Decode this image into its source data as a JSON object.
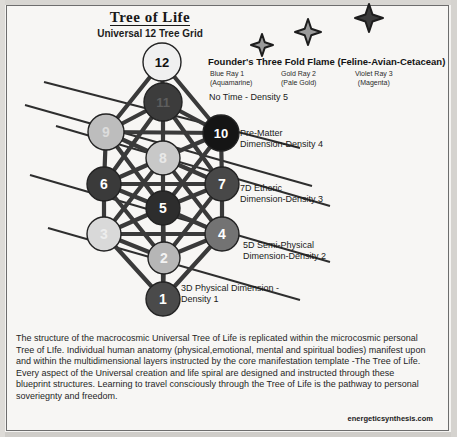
{
  "header": {
    "title": "Tree of Life",
    "subtitle": "Universal 12 Tree Grid"
  },
  "flame": {
    "heading": "Founder's Three Fold Flame (Feline-Avian-Cetacean)",
    "rays": [
      {
        "name": "Blue Ray 1",
        "color_note": "(Aquamarine)"
      },
      {
        "name": "Gold Ray 2",
        "color_note": "(Pale Gold)"
      },
      {
        "name": "Violet Ray 3",
        "color_note": "(Magenta)"
      }
    ],
    "star_count": 3
  },
  "density_labels": {
    "d5": "No Time - Density 5",
    "d4_line1": "Pre-Matter",
    "d4_line2": "Dimension-Density 4",
    "d3_line1": "7D Etheric",
    "d3_line2": "Dimension-Density 3",
    "d2_line1": "5D Semi-Physical",
    "d2_line2": "Dimension-Density 2",
    "d1_line1": "3D Physical Dimension -",
    "d1_line2": "Density 1"
  },
  "nodes": [
    {
      "id": 1,
      "label": "1",
      "cx": 163,
      "cy": 299,
      "r": 17,
      "fill": "#4a4a4a",
      "text": "#ffffff"
    },
    {
      "id": 2,
      "label": "2",
      "cx": 164,
      "cy": 258,
      "r": 16,
      "fill": "#b6b6b6",
      "text": "#f2f2f2"
    },
    {
      "id": 3,
      "label": "3",
      "cx": 104,
      "cy": 234,
      "r": 17,
      "fill": "#d9d9d9",
      "text": "#ededed"
    },
    {
      "id": 4,
      "label": "4",
      "cx": 222,
      "cy": 234,
      "r": 17,
      "fill": "#737373",
      "text": "#ffffff"
    },
    {
      "id": 5,
      "label": "5",
      "cx": 163,
      "cy": 208,
      "r": 17,
      "fill": "#2d2d2d",
      "text": "#ffffff"
    },
    {
      "id": 6,
      "label": "6",
      "cx": 104,
      "cy": 184,
      "r": 17,
      "fill": "#3a3a3a",
      "text": "#ffffff"
    },
    {
      "id": 7,
      "label": "7",
      "cx": 222,
      "cy": 184,
      "r": 17,
      "fill": "#484848",
      "text": "#ffffff"
    },
    {
      "id": 8,
      "label": "8",
      "cx": 163,
      "cy": 158,
      "r": 17,
      "fill": "#c8c8c8",
      "text": "#e8e8e8"
    },
    {
      "id": 9,
      "label": "9",
      "cx": 106,
      "cy": 132,
      "r": 18,
      "fill": "#bdbdbd",
      "text": "#dcdcdc"
    },
    {
      "id": 10,
      "label": "10",
      "cx": 221,
      "cy": 133,
      "r": 18,
      "fill": "#151515",
      "text": "#ffffff"
    },
    {
      "id": 11,
      "label": "11",
      "cx": 163,
      "cy": 102,
      "r": 19,
      "fill": "#3c3c3c",
      "text": "#5e5e5e"
    },
    {
      "id": 12,
      "label": "12",
      "cx": 162,
      "cy": 62,
      "r": 19,
      "fill": "#f0f0f0",
      "text": "#111111"
    }
  ],
  "edges": [
    [
      12,
      11
    ],
    [
      12,
      9
    ],
    [
      12,
      10
    ],
    [
      11,
      9
    ],
    [
      11,
      10
    ],
    [
      11,
      8
    ],
    [
      11,
      6
    ],
    [
      11,
      7
    ],
    [
      9,
      10
    ],
    [
      9,
      8
    ],
    [
      9,
      6
    ],
    [
      9,
      5
    ],
    [
      10,
      8
    ],
    [
      10,
      7
    ],
    [
      10,
      5
    ],
    [
      8,
      6
    ],
    [
      8,
      7
    ],
    [
      8,
      5
    ],
    [
      8,
      3
    ],
    [
      8,
      4
    ],
    [
      6,
      7
    ],
    [
      6,
      5
    ],
    [
      6,
      3
    ],
    [
      6,
      2
    ],
    [
      7,
      5
    ],
    [
      7,
      4
    ],
    [
      7,
      2
    ],
    [
      5,
      3
    ],
    [
      5,
      4
    ],
    [
      5,
      2
    ],
    [
      5,
      1
    ],
    [
      3,
      4
    ],
    [
      3,
      2
    ],
    [
      3,
      1
    ],
    [
      4,
      2
    ],
    [
      4,
      1
    ],
    [
      2,
      1
    ]
  ],
  "horizon_lines": [
    {
      "x1": 44,
      "y1": 82,
      "x2": 300,
      "y2": 148
    },
    {
      "x1": 25,
      "y1": 105,
      "x2": 312,
      "y2": 186
    },
    {
      "x1": 56,
      "y1": 126,
      "x2": 330,
      "y2": 206
    },
    {
      "x1": 30,
      "y1": 175,
      "x2": 330,
      "y2": 262
    },
    {
      "x1": 48,
      "y1": 228,
      "x2": 300,
      "y2": 300
    }
  ],
  "stars": [
    {
      "cx": 262,
      "cy": 45,
      "size": 22
    },
    {
      "cx": 308,
      "cy": 32,
      "size": 26
    },
    {
      "cx": 369,
      "cy": 18,
      "size": 28
    }
  ],
  "body": {
    "paragraph": "The structure of the macrocosmic Universal Tree of Life is replicated within the microcosmic personal Tree of LIfe. Individual human anatomy (physical,emotional, mental and spiritual bodies) manifest upon and within the multidimensional layers instructed by the core manifestation template -The Tree of Life. Every aspect of the Universal creation and life spiral are designed and instructed through these blueprint structures. Learning to travel consciously through the Tree of Life is the pathway to personal soveriegnty and freedom."
  },
  "credit": "energeticsynthesis.com",
  "colors": {
    "page_background": "#f7f6f4",
    "border": "#6d6d6d",
    "edge_stroke": "#3a3a3a",
    "horizon_stroke": "#2e2e2e",
    "text": "#1a1a1a"
  }
}
